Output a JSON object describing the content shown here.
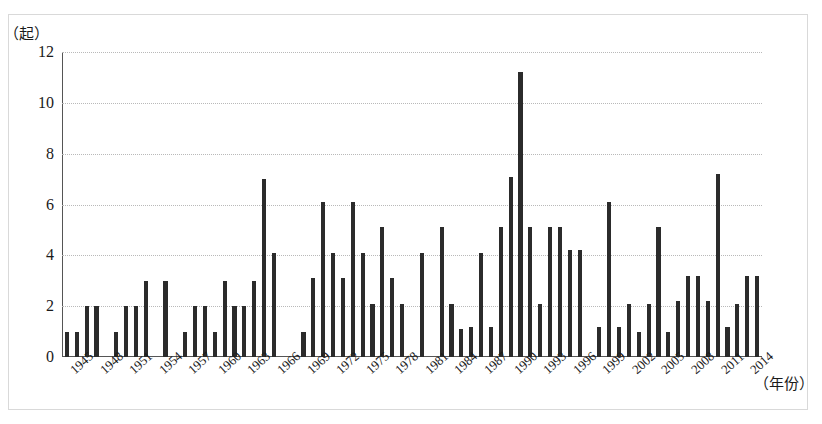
{
  "chart_data": {
    "type": "bar",
    "title": "",
    "subtitle": "",
    "xlabel": "（年份）",
    "ylabel": "（起）",
    "ylim": [
      0,
      12
    ],
    "yticks": [
      0,
      2,
      4,
      6,
      8,
      10,
      12
    ],
    "grid": true,
    "legend": false,
    "xtick_step": 3,
    "xtick_labels": [
      "1945",
      "1948",
      "1951",
      "1954",
      "1957",
      "1960",
      "1963",
      "1966",
      "1969",
      "1972",
      "1975",
      "1978",
      "1981",
      "1984",
      "1987",
      "1990",
      "1993",
      "1996",
      "1999",
      "2002",
      "2005",
      "2008",
      "2011",
      "2014"
    ],
    "categories": [
      "1945",
      "1946",
      "1947",
      "1948",
      "1949",
      "1950",
      "1951",
      "1952",
      "1953",
      "1954",
      "1955",
      "1956",
      "1957",
      "1958",
      "1959",
      "1960",
      "1961",
      "1962",
      "1963",
      "1964",
      "1965",
      "1966",
      "1967",
      "1968",
      "1969",
      "1970",
      "1971",
      "1972",
      "1973",
      "1974",
      "1975",
      "1976",
      "1977",
      "1978",
      "1979",
      "1980",
      "1981",
      "1982",
      "1983",
      "1984",
      "1985",
      "1986",
      "1987",
      "1988",
      "1989",
      "1990",
      "1991",
      "1992",
      "1993",
      "1994",
      "1995",
      "1996",
      "1997",
      "1998",
      "1999",
      "2000",
      "2001",
      "2002",
      "2003",
      "2004",
      "2005",
      "2006",
      "2007",
      "2008",
      "2009",
      "2010",
      "2011",
      "2012",
      "2013",
      "2014",
      "2015"
    ],
    "values": [
      1,
      1,
      2,
      2,
      0,
      1,
      2,
      2,
      3,
      0,
      3,
      0,
      1,
      2,
      2,
      1,
      3,
      2,
      2,
      3,
      7,
      4.1,
      0,
      0,
      1,
      3.1,
      6.1,
      4.1,
      3.1,
      6.1,
      4.1,
      2.1,
      5.1,
      3.1,
      2.1,
      0,
      4.1,
      0,
      5.1,
      2.1,
      1.1,
      1.2,
      4.1,
      1.2,
      5.1,
      7.1,
      11.2,
      5.1,
      2.1,
      5.1,
      5.1,
      4.2,
      4.2,
      0,
      1.2,
      6.1,
      1.2,
      2.1,
      1,
      2.1,
      5.1,
      1,
      2.2,
      3.2,
      3.2,
      2.2,
      7.2,
      1.2,
      2.1,
      3.2,
      3.2
    ]
  }
}
